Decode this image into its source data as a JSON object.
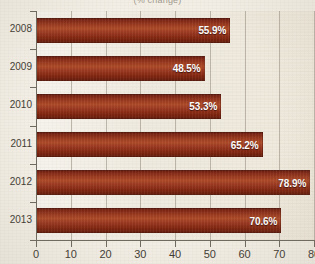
{
  "chart_data": {
    "type": "bar",
    "orientation": "horizontal",
    "title": "(% change)",
    "xlabel": "",
    "ylabel": "",
    "categories": [
      "2008",
      "2009",
      "2010",
      "2011",
      "2012",
      "2013"
    ],
    "values": [
      55.9,
      48.5,
      53.3,
      65.2,
      78.9,
      70.6
    ],
    "data_labels": [
      "55.9%",
      "48.5%",
      "53.3%",
      "65.2%",
      "78.9%",
      "70.6%"
    ],
    "xlim": [
      0,
      80
    ],
    "xticks": [
      0,
      10,
      20,
      30,
      40,
      50,
      60,
      70,
      80
    ],
    "xtick_labels": [
      "0",
      "10",
      "20",
      "30",
      "40",
      "50",
      "60",
      "70",
      "80"
    ],
    "grid": "vertical",
    "legend": null,
    "series": [
      {
        "name": "",
        "values": [
          55.9,
          48.5,
          53.3,
          65.2,
          78.9,
          70.6
        ]
      }
    ],
    "colors": {
      "bar": "#9c3a1f",
      "bar_dark": "#641c0c",
      "bar_light": "#ae4a28",
      "plot_background": "#ece6d9",
      "figure_background": "#f3efe6",
      "gridline": "#a9a294",
      "axis": "#6f6a60",
      "label_text": "#3f3b34",
      "value_text": "#ffffff"
    }
  }
}
